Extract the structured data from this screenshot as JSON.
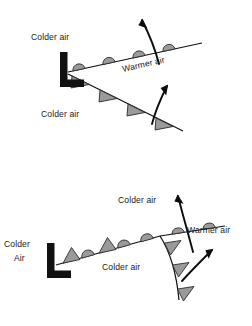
{
  "figure": {
    "background_color": "#ffffff",
    "symbol_fill": "#9a9a9a",
    "symbol_stroke": "#2b2b2b",
    "line_color": "#111111",
    "text_color": "#1a1a1a",
    "width": 252,
    "height": 326
  },
  "panels": [
    {
      "id": "upper-panel",
      "name": "mature-wave-cyclone",
      "low_center_marker": "L",
      "labels": [
        {
          "id": "upper-colder-air-top",
          "text": "Colder air",
          "x": 31,
          "y": 40,
          "anchor": "start",
          "rotation": 0
        },
        {
          "id": "upper-warmer-air",
          "text": "Warmer air",
          "x": 123,
          "y": 72,
          "anchor": "start",
          "rotation": -13
        },
        {
          "id": "upper-colder-air-bottom",
          "text": "Colder air",
          "x": 41,
          "y": 117,
          "anchor": "start",
          "rotation": 0
        }
      ],
      "fronts": [
        {
          "id": "upper-warm-front",
          "type": "warm",
          "symbol": "semicircle",
          "symbol_count": 4,
          "symbol_side": "above",
          "direction": "east-northeast"
        },
        {
          "id": "upper-cold-front",
          "type": "cold",
          "symbol": "triangle",
          "symbol_count": 4,
          "symbol_side": "below",
          "direction": "east-southeast"
        }
      ],
      "flow_arrows": [
        {
          "id": "upper-warm-air-advection-arrow",
          "points_to": "up-left",
          "crosses": "warm front"
        },
        {
          "id": "upper-cold-air-advection-arrow",
          "points_to": "up-right",
          "crosses": "cold front"
        }
      ]
    },
    {
      "id": "lower-panel",
      "name": "occluded-cyclone",
      "low_center_marker": "L",
      "labels": [
        {
          "id": "lower-colder-air-left",
          "text": "Colder",
          "x": 4,
          "y": 247,
          "anchor": "start",
          "rotation": 0
        },
        {
          "id": "lower-colder-air-left2",
          "text": "Air",
          "x": 13,
          "y": 261,
          "anchor": "start",
          "rotation": 0
        },
        {
          "id": "lower-colder-air-top",
          "text": "Colder air",
          "x": 118,
          "y": 203,
          "anchor": "start",
          "rotation": 0
        },
        {
          "id": "lower-warmer-air",
          "text": "Warmer air",
          "x": 187,
          "y": 233,
          "anchor": "start",
          "rotation": 0
        },
        {
          "id": "lower-colder-air-bottom",
          "text": "Colder air",
          "x": 102,
          "y": 270,
          "anchor": "start",
          "rotation": 0
        }
      ],
      "fronts": [
        {
          "id": "lower-occluded-front",
          "type": "occluded",
          "symbol": "alternating-triangle-semicircle",
          "symbol_count": 4,
          "symbol_side": "above",
          "direction": "east-northeast"
        },
        {
          "id": "lower-warm-front",
          "type": "warm",
          "symbol": "semicircle",
          "symbol_count": 2,
          "symbol_side": "above",
          "direction": "east"
        },
        {
          "id": "lower-cold-front",
          "type": "cold",
          "symbol": "triangle",
          "symbol_count": 3,
          "symbol_side": "right",
          "direction": "south"
        }
      ],
      "flow_arrows": [
        {
          "id": "lower-warm-air-advection-arrow",
          "points_to": "up",
          "crosses": "occluded/warm front junction"
        },
        {
          "id": "lower-cold-air-advection-arrow",
          "points_to": "up-right",
          "crosses": "cold front"
        }
      ]
    }
  ]
}
